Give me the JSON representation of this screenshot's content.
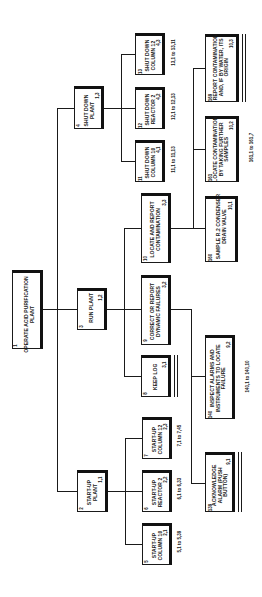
{
  "diagram": {
    "orientation": "rotated 90 degrees counter-clockwise",
    "nodes": {
      "n1": {
        "id": "1",
        "code": "",
        "label": "OPERATE ACID PURIFICATION PLANT"
      },
      "n2": {
        "id": "2",
        "code": "1,1",
        "label": "START-UP PLANT"
      },
      "n3": {
        "id": "3",
        "code": "1,2",
        "label": "RUN PLANT"
      },
      "n4": {
        "id": "4",
        "code": "1,3",
        "label": "SHUT DOWN PLANT"
      },
      "n5": {
        "id": "5",
        "code": "2,1",
        "label": "START-UP COLUMN 10",
        "range": "5,1 to 5,39"
      },
      "n6": {
        "id": "6",
        "code": "2,2",
        "label": "START-UP REACTOR 2",
        "range": "6,1 to 6,33"
      },
      "n7": {
        "id": "7",
        "code": "2,3",
        "label": "START-UP COLUMN 12",
        "range": "7,1 to 7,45"
      },
      "n8": {
        "id": "8",
        "code": "3,1",
        "label": "KEEP LOG"
      },
      "n9": {
        "id": "9",
        "code": "3,2",
        "label": "CORRECT OR REPORT DYNAMIC FAILURES"
      },
      "n10": {
        "id": "10",
        "code": "3,3",
        "label": "LOCATE AND REPORT CONTAMINATION"
      },
      "n11": {
        "id": "11",
        "code": "4,1",
        "label": "SHUT DOWN COLUMN 10",
        "range": "11,1 to 11,13"
      },
      "n12": {
        "id": "12",
        "code": "4,2",
        "label": "SHUT DOWN REACTOR 2",
        "range": "12,1 to 12,13"
      },
      "n13": {
        "id": "13",
        "code": "4,3",
        "label": "SHUT DOWN COLUMN 12",
        "range": "13,1 to 13,11"
      },
      "n139": {
        "id": "139",
        "code": "9,1",
        "label": "ACKNOWLEDGE ALARM (PUSH BUTTON)"
      },
      "n140": {
        "id": "140",
        "code": "9,2",
        "label": "INSPECT ALARMS AND INSTRUMENTS TO LOCATE FAILURE",
        "range": "140,1 to 140,10"
      },
      "n160": {
        "id": "160",
        "code": "10,1",
        "label": "SAMPLE R.2 CONDENSER DRAIN VALVE"
      },
      "n161": {
        "id": "161",
        "code": "10,2",
        "label": "LOCATE CONTAMINATION BY TAKING FURTHER SAMPLES",
        "range": "161,1 to 161,7"
      },
      "n169": {
        "id": "169",
        "code": "10,3",
        "label": "REPORT CONTAMINATION AND, IF BY WATER, ITS ORIGIN"
      }
    },
    "edges": [
      [
        "1",
        "2"
      ],
      [
        "1",
        "3"
      ],
      [
        "1",
        "4"
      ],
      [
        "2",
        "5"
      ],
      [
        "2",
        "6"
      ],
      [
        "2",
        "7"
      ],
      [
        "3",
        "8"
      ],
      [
        "3",
        "9"
      ],
      [
        "3",
        "10"
      ],
      [
        "4",
        "11"
      ],
      [
        "4",
        "12"
      ],
      [
        "4",
        "13"
      ],
      [
        "9",
        "139"
      ],
      [
        "9",
        "140"
      ],
      [
        "10",
        "160"
      ],
      [
        "10",
        "161"
      ],
      [
        "10",
        "169"
      ]
    ]
  }
}
